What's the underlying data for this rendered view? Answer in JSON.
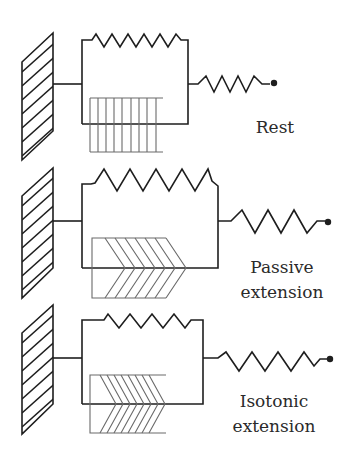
{
  "figure": {
    "panels": [
      {
        "id": "rest",
        "label_lines": [
          "Rest"
        ]
      },
      {
        "id": "passive",
        "label_lines": [
          "Passive",
          "extension"
        ]
      },
      {
        "id": "isotonic",
        "label_lines": [
          "Isotonic",
          "extension"
        ]
      }
    ]
  },
  "colors": {
    "line": "#1e1e1e",
    "filament": "#6a6a6a",
    "background": "#ffffff"
  }
}
